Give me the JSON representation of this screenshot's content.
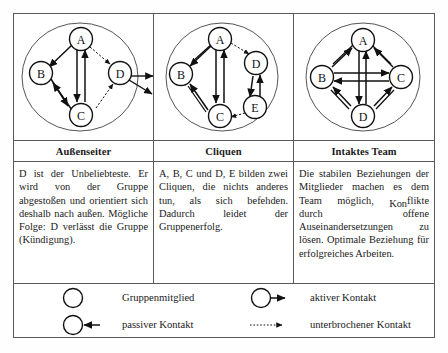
{
  "panels": [
    {
      "caption": "Außenseiter",
      "text": "D ist der Unbeliebteste. Er wird von der Gruppe abgestoßen und orientiert sich deshalb nach außen. Mögliche Folge: D verlässt die Gruppe (Kündigung).",
      "nodes": [
        "A",
        "B",
        "C",
        "D"
      ],
      "edges": [
        {
          "from": "A",
          "to": "B",
          "style": "solid",
          "direction": "single"
        },
        {
          "from": "A",
          "to": "C",
          "style": "solid",
          "direction": "double"
        },
        {
          "from": "A",
          "to": "D",
          "style": "dotted",
          "direction": "single"
        },
        {
          "from": "B",
          "to": "C",
          "style": "solid",
          "direction": "double"
        },
        {
          "from": "C",
          "to": "D",
          "style": "dotted",
          "direction": "single"
        },
        {
          "from": "D",
          "to": "outside",
          "style": "solid",
          "direction": "single"
        },
        {
          "from": "D",
          "to": "outside2",
          "style": "solid",
          "direction": "single"
        }
      ]
    },
    {
      "caption": "Cliquen",
      "text": "A, B, C und D, E bilden zwei Cliquen, die nichts anderes tun, als sich befehden. Dadurch leidet der Gruppenerfolg.",
      "nodes": [
        "A",
        "B",
        "C",
        "D",
        "E"
      ],
      "edges": [
        {
          "from": "A",
          "to": "B",
          "style": "solid",
          "direction": "double"
        },
        {
          "from": "A",
          "to": "C",
          "style": "solid",
          "direction": "double"
        },
        {
          "from": "B",
          "to": "C",
          "style": "solid",
          "direction": "double"
        },
        {
          "from": "A",
          "to": "D",
          "style": "dotted",
          "direction": "single"
        },
        {
          "from": "D",
          "to": "E",
          "style": "solid",
          "direction": "double"
        },
        {
          "from": "E",
          "to": "C",
          "style": "dotted",
          "direction": "single"
        }
      ]
    },
    {
      "caption": "Intaktes Team",
      "text_part1": "Die stabilen Beziehungen der Mitglieder machen es dem Team möglich, ",
      "text_kon": "Kon",
      "text_part2": "flikte durch offene Auseinandersetzungen zu lösen. Optimale Beziehung für erfolgreiches Arbeiten.",
      "nodes": [
        "A",
        "B",
        "C",
        "D"
      ],
      "edges": [
        {
          "from": "A",
          "to": "B",
          "style": "solid",
          "direction": "double"
        },
        {
          "from": "A",
          "to": "C",
          "style": "solid",
          "direction": "double"
        },
        {
          "from": "A",
          "to": "D",
          "style": "solid",
          "direction": "double"
        },
        {
          "from": "B",
          "to": "C",
          "style": "solid",
          "direction": "double"
        },
        {
          "from": "B",
          "to": "D",
          "style": "solid",
          "direction": "double"
        },
        {
          "from": "C",
          "to": "D",
          "style": "solid",
          "direction": "double"
        }
      ]
    }
  ],
  "legend": {
    "items": [
      {
        "symbol": "circle",
        "label": "Gruppenmitglied"
      },
      {
        "symbol": "circle-arrow-right",
        "label": "aktiver Kontakt"
      },
      {
        "symbol": "circle-arrow-in",
        "label": "passiver Kontakt"
      },
      {
        "symbol": "dotted-arrow",
        "label": "unterbrochener Kontakt"
      }
    ]
  },
  "colors": {
    "line": "#1a1a1a",
    "border": "#5a5a5a",
    "background": "#ffffff"
  }
}
